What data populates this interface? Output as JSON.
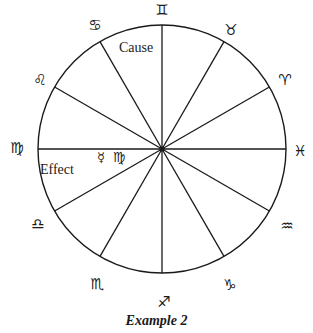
{
  "diagram": {
    "type": "zodiac-wheel",
    "center": {
      "x": 162,
      "y": 149
    },
    "radius": 124,
    "stroke_color": "#1a1a1a",
    "spokes_deg": [
      90,
      60,
      30,
      0,
      -30,
      -60,
      -90,
      -120,
      -150,
      180,
      150,
      120
    ],
    "signs": [
      {
        "name": "gemini",
        "glyph": "♊",
        "x": 162,
        "y": 10
      },
      {
        "name": "taurus",
        "glyph": "♉",
        "x": 231,
        "y": 30
      },
      {
        "name": "aries",
        "glyph": "♈",
        "x": 285,
        "y": 80
      },
      {
        "name": "pisces",
        "glyph": "♓",
        "x": 300,
        "y": 151
      },
      {
        "name": "aquarius",
        "glyph": "♒",
        "x": 287,
        "y": 226
      },
      {
        "name": "capricorn",
        "glyph": "♑",
        "x": 230,
        "y": 285
      },
      {
        "name": "sagittarius",
        "glyph": "♐",
        "x": 164,
        "y": 302
      },
      {
        "name": "scorpio",
        "glyph": "♏",
        "x": 97,
        "y": 284
      },
      {
        "name": "libra",
        "glyph": "♎",
        "x": 38,
        "y": 224
      },
      {
        "name": "virgo",
        "glyph": "♍",
        "x": 17,
        "y": 148
      },
      {
        "name": "leo",
        "glyph": "♌",
        "x": 40,
        "y": 80
      },
      {
        "name": "cancer",
        "glyph": "♋",
        "x": 95,
        "y": 25
      }
    ],
    "labels": {
      "cause": "Cause",
      "effect": "Effect",
      "planet_glyph": "☿",
      "planet_sign_glyph": "♍"
    },
    "caption": "Example 2"
  }
}
